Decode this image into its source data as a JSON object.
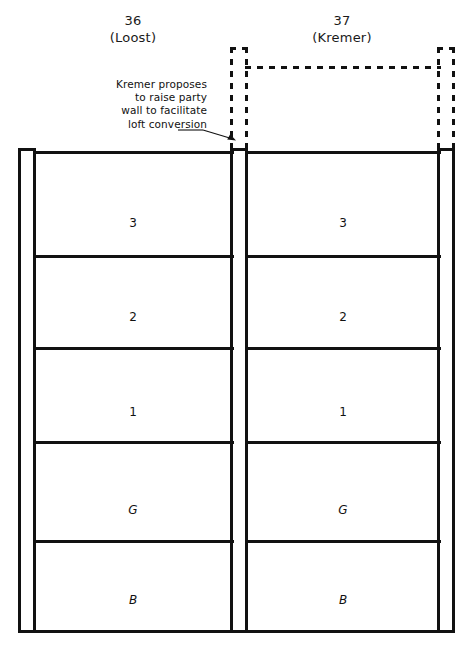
{
  "drawing": {
    "title": "Party wall section — loft conversion proposal",
    "stroke_color": "#111111",
    "background_color": "#ffffff"
  },
  "properties": [
    {
      "number": "36",
      "owner": "(Loost)"
    },
    {
      "number": "37",
      "owner": "(Kremer)"
    }
  ],
  "annotation": {
    "lines": [
      "Kremer proposes",
      "to raise party",
      "wall to facilitate",
      "loft conversion"
    ],
    "arrow_target": "party-wall-top"
  },
  "floors": {
    "left": [
      {
        "label": "3"
      },
      {
        "label": "2"
      },
      {
        "label": "1"
      },
      {
        "label": "G"
      },
      {
        "label": "B"
      }
    ],
    "right": [
      {
        "label": "3"
      },
      {
        "label": "2"
      },
      {
        "label": "1"
      },
      {
        "label": "G"
      },
      {
        "label": "B"
      }
    ]
  },
  "proposed_extension": {
    "style": "dashed",
    "description": "raised party wall and flank walls for loft conversion above no. 37"
  }
}
